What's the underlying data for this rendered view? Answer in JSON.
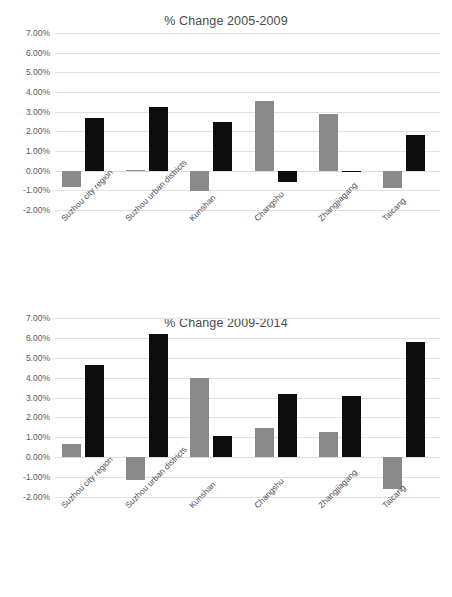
{
  "page": {
    "background_color": "#ffffff",
    "width": 452,
    "height": 597
  },
  "palette": {
    "series_1_color": "#8a8a8a",
    "series_2_color": "#0d0d0d",
    "gridline_color": "#e2e2e2",
    "tick_text_color": "#5a5a5a",
    "title_text_color": "#4a4a4a"
  },
  "charts": [
    {
      "id": "chart-1",
      "title": "% Change 2005-2009",
      "y_ticks": [
        "7.00%",
        "6.00%",
        "5.00%",
        "4.00%",
        "3.00%",
        "2.00%",
        "1.00%",
        "0.00%",
        "-1.00%",
        "-2.00%"
      ],
      "x_labels": [
        "Suzhou city region",
        "Suzhou urban districts",
        "Kunshan",
        "Changshu",
        "Zhangjiagang",
        "Taicang"
      ]
    },
    {
      "id": "chart-2",
      "title": "% Change 2009-2014",
      "y_ticks": [
        "7.00%",
        "6.00%",
        "5.00%",
        "4.00%",
        "3.00%",
        "2.00%",
        "1.00%",
        "0.00%",
        "-1.00%",
        "-2.00%"
      ],
      "x_labels": [
        "Suzhou city region",
        "Suzhou urban districts",
        "Kunshan",
        "Changshu",
        "Zhangjiagang",
        "Taicang"
      ]
    }
  ],
  "chart_data": [
    {
      "type": "bar",
      "title": "% Change 2005-2009",
      "xlabel": "",
      "ylabel": "",
      "ylim": [
        -2.0,
        7.0
      ],
      "y_tick_values": [
        7.0,
        6.0,
        5.0,
        4.0,
        3.0,
        2.0,
        1.0,
        0.0,
        -1.0,
        -2.0
      ],
      "y_tick_labels": [
        "7.00%",
        "6.00%",
        "5.00%",
        "4.00%",
        "3.00%",
        "2.00%",
        "1.00%",
        "0.00%",
        "-1.00%",
        "-2.00%"
      ],
      "grid": true,
      "legend": "none",
      "categories": [
        "Suzhou city region",
        "Suzhou urban districts",
        "Kunshan",
        "Changshu",
        "Zhangjiagang",
        "Taicang"
      ],
      "series": [
        {
          "name": "Series 1",
          "color": "#8a8a8a",
          "values": [
            -0.85,
            0.05,
            -1.05,
            3.55,
            2.88,
            -0.88
          ]
        },
        {
          "name": "Series 2",
          "color": "#0d0d0d",
          "values": [
            2.68,
            3.25,
            2.45,
            -0.58,
            -0.07,
            1.8
          ]
        }
      ]
    },
    {
      "type": "bar",
      "title": "% Change 2009-2014",
      "xlabel": "",
      "ylabel": "",
      "ylim": [
        -2.0,
        7.0
      ],
      "y_tick_values": [
        7.0,
        6.0,
        5.0,
        4.0,
        3.0,
        2.0,
        1.0,
        0.0,
        -1.0,
        -2.0
      ],
      "y_tick_labels": [
        "7.00%",
        "6.00%",
        "5.00%",
        "4.00%",
        "3.00%",
        "2.00%",
        "1.00%",
        "0.00%",
        "-1.00%",
        "-2.00%"
      ],
      "grid": true,
      "legend": "none",
      "categories": [
        "Suzhou city region",
        "Suzhou urban districts",
        "Kunshan",
        "Changshu",
        "Zhangjiagang",
        "Taicang"
      ],
      "series": [
        {
          "name": "Series 1",
          "color": "#8a8a8a",
          "values": [
            0.65,
            -1.15,
            3.98,
            1.48,
            1.25,
            -1.6
          ]
        },
        {
          "name": "Series 2",
          "color": "#0d0d0d",
          "values": [
            4.65,
            6.22,
            1.05,
            3.2,
            3.08,
            5.8
          ]
        }
      ]
    }
  ]
}
